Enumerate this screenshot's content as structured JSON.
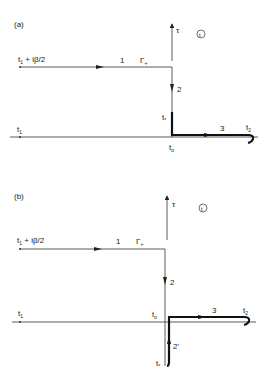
{
  "panels": [
    {
      "id": "a",
      "label": "(a)",
      "start_label": "t",
      "start_sub": "1",
      "start_suffix": " + iβ/2",
      "axis_left_label": "t",
      "axis_left_sub": "1",
      "segment1_label": "1",
      "gamma_label": "Γ",
      "gamma_sub": "+",
      "segment2_label": "2",
      "tstar_label": "t",
      "tstar_sub": "*",
      "t0_label": "t",
      "t0_sub": "o",
      "segment3_label": "3",
      "t2_label": "t",
      "t2_sub": "2",
      "tau_label": "τ",
      "plane_label": "t"
    },
    {
      "id": "b",
      "label": "(b)",
      "start_label": "t",
      "start_sub": "1",
      "start_suffix": " + iβ/2",
      "axis_left_label": "t",
      "axis_left_sub": "1",
      "segment1_label": "1",
      "gamma_label": "Γ",
      "gamma_sub": "+",
      "segment2_label": "2",
      "segment2p_label": "2'",
      "tstar_label": "t",
      "tstar_sub": "*",
      "t0_label": "t",
      "t0_sub": "o",
      "segment3_label": "3",
      "t2_label": "t",
      "t2_sub": "2",
      "tau_label": "τ",
      "plane_label": "t"
    }
  ],
  "colors": {
    "line": "#333333",
    "thick": "#111111"
  }
}
